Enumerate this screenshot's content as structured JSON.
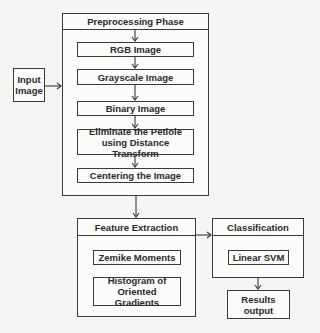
{
  "diagram": {
    "input": {
      "label": "Input Image"
    },
    "preprocessing": {
      "title": "Preprocessing Phase",
      "steps": [
        {
          "label": "RGB Image"
        },
        {
          "label": "Grayscale Image"
        },
        {
          "label": "Binary Image"
        },
        {
          "label": "Eliminate the Petiole using Distance Transform"
        },
        {
          "label": "Centering the Image"
        }
      ]
    },
    "feature_extraction": {
      "title": "Feature Extraction",
      "items": [
        {
          "label": "Zemike Moments"
        },
        {
          "label": "Histogram of Oriented Gradients"
        }
      ]
    },
    "classification": {
      "title": "Classification",
      "items": [
        {
          "label": "Linear SVM"
        }
      ]
    },
    "output": {
      "label": "Results output"
    },
    "edges": [
      {
        "from": "Input Image",
        "to": "Preprocessing Phase"
      },
      {
        "from": "Preprocessing Phase",
        "to": "RGB Image"
      },
      {
        "from": "RGB Image",
        "to": "Grayscale Image"
      },
      {
        "from": "Grayscale Image",
        "to": "Binary Image"
      },
      {
        "from": "Binary Image",
        "to": "Eliminate the Petiole using Distance Transform"
      },
      {
        "from": "Eliminate the Petiole using Distance Transform",
        "to": "Centering the Image"
      },
      {
        "from": "Preprocessing Phase",
        "to": "Feature Extraction"
      },
      {
        "from": "Feature Extraction",
        "to": "Classification"
      },
      {
        "from": "Classification",
        "to": "Results output"
      }
    ],
    "colors": {
      "stroke": "#3a3a3a",
      "fill": "#fbfbfa",
      "background": "#f4f4f2"
    }
  }
}
